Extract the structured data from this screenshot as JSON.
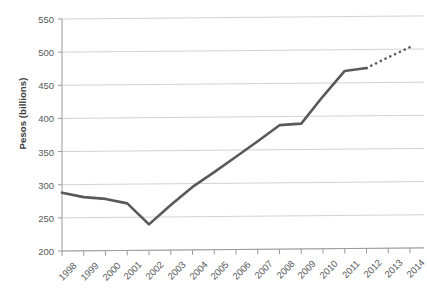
{
  "chart_data": {
    "type": "line",
    "title": "",
    "subtitle": "",
    "xlabel": "",
    "ylabel": "Pesos (billions)",
    "x": [
      1998,
      1999,
      2000,
      2001,
      2002,
      2003,
      2004,
      2005,
      2006,
      2007,
      2008,
      2009,
      2010,
      2011,
      2012,
      2013,
      2014
    ],
    "categories": [
      "1998",
      "1999",
      "2000",
      "2001",
      "2002",
      "2003",
      "2004",
      "2005",
      "2006",
      "2007",
      "2008",
      "2009",
      "2010",
      "2011",
      "2012",
      "2013",
      "2014"
    ],
    "xlim": [
      1998,
      2014
    ],
    "ylim": [
      200,
      550
    ],
    "yticks": [
      200,
      250,
      300,
      350,
      400,
      450,
      500,
      550
    ],
    "ytick_labels": [
      "200",
      "250",
      "300",
      "350",
      "400",
      "450",
      "500",
      "550"
    ],
    "grid": "horizontal",
    "legend": "none",
    "series": [
      {
        "name": "Pesos (billions) actual",
        "style": "solid",
        "color": "#595959",
        "x": [
          1998,
          1999,
          2000,
          2001,
          2002,
          2003,
          2004,
          2005,
          2006,
          2007,
          2008,
          2009,
          2010,
          2011,
          2012
        ],
        "values": [
          288,
          281,
          278,
          271,
          239,
          268,
          295,
          317,
          340,
          363,
          387,
          389,
          430,
          468,
          472
        ]
      },
      {
        "name": "Pesos (billions) projected",
        "style": "dotted",
        "color": "#595959",
        "x": [
          2012,
          2013,
          2014
        ],
        "values": [
          472,
          488,
          503
        ]
      }
    ],
    "annotations": []
  },
  "axis": {
    "y_title": "Pesos (billions)"
  }
}
